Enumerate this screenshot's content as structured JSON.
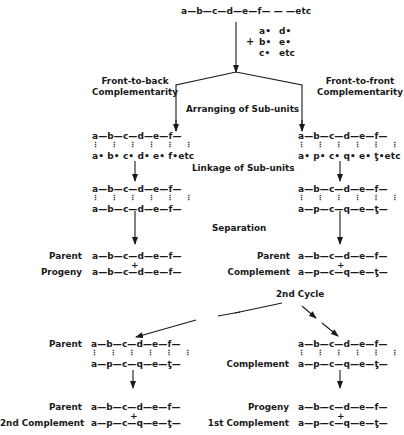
{
  "top": {
    "polymer": "a—b—c—d—e—f— — —etc",
    "plus": "+",
    "subunits_col1": [
      "a•",
      "b•",
      "c•"
    ],
    "subunits_col2": [
      "d•",
      "e•",
      "etc"
    ]
  },
  "branches": {
    "left_title_line1": "Front-to-back",
    "left_title_line2": "Complementarity",
    "right_title_line1": "Front-to-front",
    "right_title_line2": "Complementarity"
  },
  "steps": {
    "arranging": "Arranging of Sub-units",
    "linkage": "Linkage of Sub-units",
    "separation": "Separation",
    "second_cycle": "2nd Cycle"
  },
  "left": {
    "arrange_top": "a—b—c—d—e—f—",
    "arrange_links": "⋮ ⋮ ⋮ ⋮ ⋮ ⋮",
    "arrange_bottom": "a• b• c• d• e• f•etc",
    "link_top": "a—b—c—d—e—f—",
    "link_links": "⋮ ⋮ ⋮ ⋮ ⋮ ⋮",
    "link_bottom": "a—b—c—d—e—f—",
    "sep_label_1": "Parent",
    "sep_chain_1": "a—b—c—d—e—f—",
    "sep_plus": "+",
    "sep_label_2": "Progeny",
    "sep_chain_2": "a—b—c—d—e—f—"
  },
  "right": {
    "arrange_top": "a—b—c—d—e—f—",
    "arrange_links": "⋮ ⋮ ⋮ ⋮ ⋮ ⋮",
    "arrange_bottom": "a• p• c• q• e• ƫ•etc",
    "link_top": "a—b—c—d—e—f—",
    "link_links": "⋮ ⋮ ⋮ ⋮ ⋮ ⋮",
    "link_bottom": "a—p—c—q—e—ƫ—",
    "sep_label_1": "Parent",
    "sep_chain_1": "a—b—c—d—e—f—",
    "sep_plus": "+",
    "sep_label_2": "Complement",
    "sep_chain_2": "a—p—c—q—e—ƫ—"
  },
  "cycle2_left": {
    "label": "Parent",
    "top": "a—b—c—d—e—f—",
    "links": "⋮ ⋮ ⋮ ⋮ ⋮ ⋮",
    "bottom": "a—p—c—q—e—ƫ—",
    "res_label_1": "Parent",
    "res_chain_1": "a—b—c—d—e—f—",
    "res_plus": "+",
    "res_label_2": "2nd Complement",
    "res_chain_2": "a—p—c—q—e—ƫ—"
  },
  "cycle2_right": {
    "label": "Complement",
    "top": "a—b—c—d—e—f—",
    "links": "⋮ ⋮ ⋮ ⋮ ⋮ ⋮",
    "bottom": "a—p—c—q—e—ƫ—",
    "res_label_1": "Progeny",
    "res_chain_1": "a—b—c—d—e—f—",
    "res_plus": "+",
    "res_label_2": "1st Complement",
    "res_chain_2": "a—p—c—q—e—ƫ—"
  }
}
